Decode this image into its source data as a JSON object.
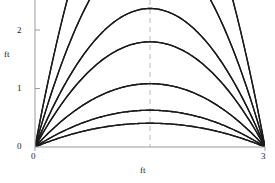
{
  "figure": {
    "background_color": "#ffffff",
    "curve_color": "#1a1a1a",
    "axis_color": "#9a9a9a",
    "guide_color": "#a8a8a8"
  },
  "axes": {
    "x_title": "ft",
    "y_title": "ft",
    "x_ticks": [
      "0",
      "3"
    ],
    "y_ticks": [
      "0",
      "1",
      "2"
    ]
  },
  "chart_data": {
    "type": "line",
    "title": "",
    "xlabel": "ft",
    "ylabel": "ft",
    "xlim": [
      0,
      3
    ],
    "ylim": [
      0,
      2.6
    ],
    "x_ticks": [
      0,
      3
    ],
    "y_ticks": [
      0,
      1,
      2
    ],
    "grid": false,
    "legend": "none",
    "annotations": [
      {
        "type": "vertical-dashed-guide",
        "x": 1.5,
        "label": "",
        "color": "#a8a8a8"
      }
    ],
    "series": [
      {
        "name": "launch-0-angle-1",
        "origin": [
          0,
          0
        ],
        "landing": [
          3,
          0
        ],
        "apex": [
          1.5,
          0.42
        ],
        "clipped_top": false
      },
      {
        "name": "launch-0-angle-2",
        "origin": [
          0,
          0
        ],
        "landing": [
          3,
          0
        ],
        "apex": [
          1.5,
          0.65
        ],
        "clipped_top": false
      },
      {
        "name": "launch-0-angle-3",
        "origin": [
          0,
          0
        ],
        "landing": [
          3,
          0
        ],
        "apex": [
          1.5,
          1.12
        ],
        "clipped_top": false
      },
      {
        "name": "launch-0-angle-4",
        "origin": [
          0,
          0
        ],
        "landing": [
          3,
          0
        ],
        "apex": [
          1.5,
          1.86
        ],
        "clipped_top": false
      },
      {
        "name": "launch-0-angle-5",
        "origin": [
          0,
          0
        ],
        "landing": [
          3,
          0
        ],
        "apex": [
          1.5,
          2.45
        ],
        "clipped_top": false
      },
      {
        "name": "launch-0-angle-6",
        "origin": [
          0,
          0
        ],
        "landing": [
          3,
          0
        ],
        "apex": [
          1.5,
          3.6
        ],
        "clipped_top": true
      },
      {
        "name": "launch-0-angle-7",
        "origin": [
          0,
          0
        ],
        "landing": [
          3,
          0
        ],
        "apex": [
          1.5,
          5.4
        ],
        "clipped_top": true
      },
      {
        "name": "launch-3-angle-1",
        "origin": [
          3,
          0
        ],
        "landing": [
          0,
          0
        ],
        "apex": [
          1.5,
          0.42
        ],
        "clipped_top": false
      },
      {
        "name": "launch-3-angle-2",
        "origin": [
          3,
          0
        ],
        "landing": [
          0,
          0
        ],
        "apex": [
          1.5,
          0.65
        ],
        "clipped_top": false
      },
      {
        "name": "launch-3-angle-3",
        "origin": [
          3,
          0
        ],
        "landing": [
          0,
          0
        ],
        "apex": [
          1.5,
          1.12
        ],
        "clipped_top": false
      },
      {
        "name": "launch-3-angle-4",
        "origin": [
          3,
          0
        ],
        "landing": [
          0,
          0
        ],
        "apex": [
          1.5,
          1.86
        ],
        "clipped_top": false
      },
      {
        "name": "launch-3-angle-5",
        "origin": [
          3,
          0
        ],
        "landing": [
          0,
          0
        ],
        "apex": [
          1.5,
          2.45
        ],
        "clipped_top": false
      },
      {
        "name": "launch-3-angle-6",
        "origin": [
          3,
          0
        ],
        "landing": [
          0,
          0
        ],
        "apex": [
          1.5,
          3.6
        ],
        "clipped_top": true
      },
      {
        "name": "launch-3-angle-7",
        "origin": [
          3,
          0
        ],
        "landing": [
          0,
          0
        ],
        "apex": [
          1.5,
          5.4
        ],
        "clipped_top": true
      }
    ]
  }
}
